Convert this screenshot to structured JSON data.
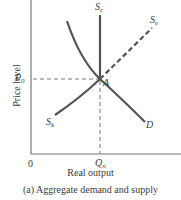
{
  "figure": {
    "caption": "(a) Aggregate demand and supply",
    "x_axis_label": "Real output",
    "y_axis_label": "Price level",
    "origin_label": "0"
  },
  "labels": {
    "price_equilibrium": {
      "main": "P",
      "sub": "0"
    },
    "output_equilibrium": {
      "main": "Q",
      "sub": "n"
    },
    "equilibrium_point": "A",
    "curve_sc": {
      "main": "S",
      "sub": "c"
    },
    "curve_se": {
      "main": "S",
      "sub": "e"
    },
    "curve_sk": {
      "main": "S",
      "sub": "k"
    },
    "curve_d": "D"
  },
  "colors": {
    "curve": "#555555",
    "axis": "#777777",
    "dashed": "#777777",
    "text": "#3a3a3a"
  }
}
